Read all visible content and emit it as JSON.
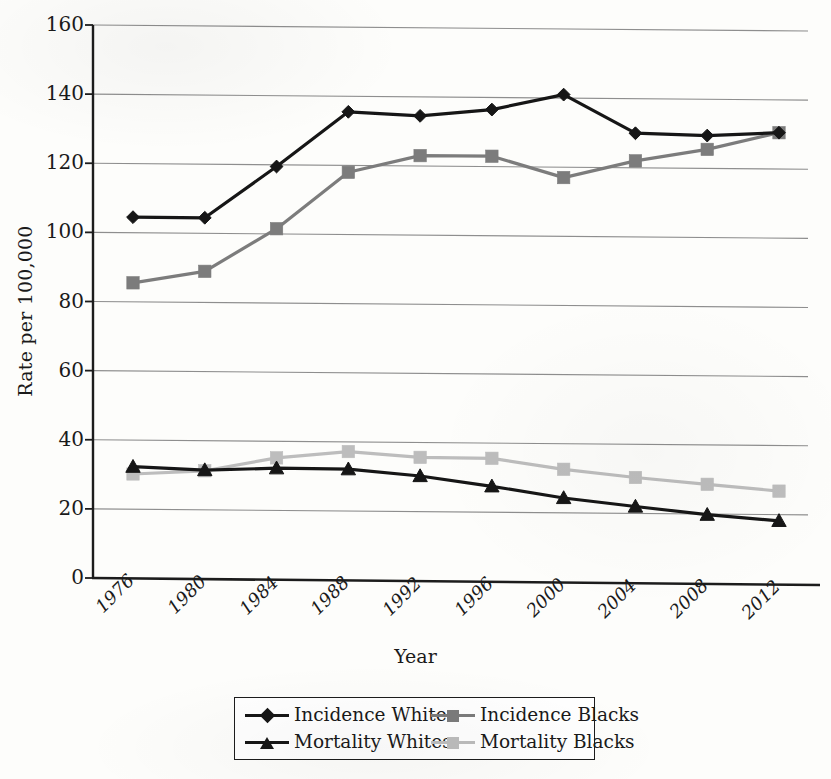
{
  "chart_data": {
    "type": "line",
    "title": "",
    "xlabel": "Year",
    "ylabel": "Rate per 100,000",
    "categories": [
      "1976",
      "1980",
      "1984",
      "1988",
      "1992",
      "1996",
      "2000",
      "2004",
      "2008",
      "2012"
    ],
    "x": [
      1976,
      1980,
      1984,
      1988,
      1992,
      1996,
      2000,
      2004,
      2008,
      2012
    ],
    "ylim": [
      0,
      160
    ],
    "yticks": [
      0,
      20,
      40,
      60,
      80,
      100,
      120,
      140,
      160
    ],
    "grid": "horizontal",
    "legend_position": "bottom",
    "series": [
      {
        "name": "Incidence Whites",
        "color": "#161616",
        "marker": "diamond",
        "values": [
          104.5,
          104.5,
          119.5,
          135.5,
          134.5,
          136.5,
          141.0,
          130.0,
          129.5,
          130.5
        ]
      },
      {
        "name": "Incidence Blacks",
        "color": "#7c7c7c",
        "marker": "square",
        "values": [
          85.5,
          89.0,
          101.5,
          118.0,
          123.0,
          123.0,
          117.0,
          122.0,
          125.5,
          130.5
        ]
      },
      {
        "name": "Mortality Whites",
        "color": "#161616",
        "marker": "triangle",
        "values": [
          32.3,
          31.5,
          32.2,
          32.1,
          30.3,
          27.5,
          24.3,
          22.0,
          19.8,
          18.2
        ]
      },
      {
        "name": "Mortality Blacks",
        "color": "#bdbdbd",
        "marker": "square",
        "values": [
          30.2,
          31.3,
          35.2,
          37.2,
          35.7,
          35.6,
          32.6,
          30.4,
          28.6,
          26.8
        ]
      }
    ]
  },
  "axes": {
    "y_title": "Rate per 100,000",
    "x_title": "Year",
    "y_tick_labels": [
      "160",
      "140",
      "120",
      "100",
      "80",
      "60",
      "40",
      "20",
      "0"
    ],
    "x_tick_labels": [
      "1976",
      "1980",
      "1984",
      "1988",
      "1992",
      "1996",
      "2000",
      "2004",
      "2008",
      "2012"
    ]
  },
  "legend": {
    "rows": [
      {
        "left": "Incidence Whites",
        "right": "Incidence Blacks"
      },
      {
        "left": "Mortality Whites",
        "right": "Mortality Blacks"
      }
    ],
    "items": [
      {
        "label": "Incidence Whites",
        "color": "#161616",
        "marker": "diamond"
      },
      {
        "label": "Incidence Blacks",
        "color": "#7c7c7c",
        "marker": "square"
      },
      {
        "label": "Mortality Whites",
        "color": "#161616",
        "marker": "triangle"
      },
      {
        "label": "Mortality Blacks",
        "color": "#bdbdbd",
        "marker": "square"
      }
    ]
  },
  "colors": {
    "axis": "#1c1c1c",
    "grid": "#8e8e8e",
    "background": "#fdfdfb",
    "incidence_whites": "#161616",
    "incidence_blacks": "#7c7c7c",
    "mortality_whites": "#161616",
    "mortality_blacks": "#bdbdbd"
  }
}
